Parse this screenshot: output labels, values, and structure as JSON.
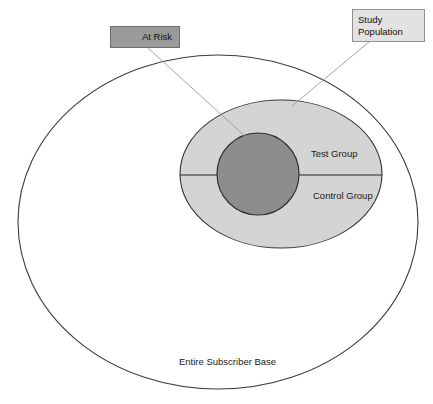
{
  "diagram": {
    "colors": {
      "page_background": "#ffffff",
      "outer_ellipse_fill": "#ffffff",
      "outer_ellipse_stroke": "#3a3a3a",
      "study_ellipse_fill": "#d4d4d4",
      "study_ellipse_stroke": "#333333",
      "at_risk_circle_fill": "#8d8d8d",
      "at_risk_circle_stroke": "#303030",
      "divider_line": "#262626",
      "leader_line": "#9b9b9b",
      "at_risk_box_fill": "#9a9a9a",
      "at_risk_box_stroke": "#6e6e6e",
      "study_box_fill": "#e2e2e2",
      "study_box_stroke": "#8f8f8f",
      "label_text": "#1a1a1a"
    },
    "shapes": {
      "outer_ellipse": {
        "name": "Entire Subscriber Base",
        "cx": 218,
        "cy": 222,
        "rx": 200,
        "ry": 167
      },
      "study_ellipse": {
        "name": "Study Population",
        "cx": 281,
        "cy": 174,
        "rx": 101,
        "ry": 74
      },
      "at_risk_circle": {
        "name": "At Risk",
        "cx": 258,
        "cy": 174,
        "r": 41
      },
      "divider_line": {
        "name": "Test / Control split",
        "x1": 180,
        "y1": 175,
        "x2": 382,
        "y2": 175
      }
    },
    "leader_lines": [
      {
        "name": "at-risk-leader",
        "from_label": "At Risk",
        "x1": 148,
        "y1": 48,
        "x2": 247,
        "y2": 138
      },
      {
        "name": "study-population-leader",
        "from_label": "Study Population",
        "x1": 369,
        "y1": 42,
        "x2": 292,
        "y2": 106
      }
    ],
    "labels": {
      "at_risk": "At Risk",
      "study_population_line1": "Study",
      "study_population_line2": "Population",
      "test_group": "Test Group",
      "control_group": "Control Group",
      "entire_subscriber_base": "Entire Subscriber Base"
    },
    "label_positions": {
      "test_group": {
        "x": 311,
        "y": 157
      },
      "control_group": {
        "x": 313,
        "y": 199
      },
      "entire_subscriber_base": {
        "x": 179,
        "y": 365
      }
    }
  }
}
